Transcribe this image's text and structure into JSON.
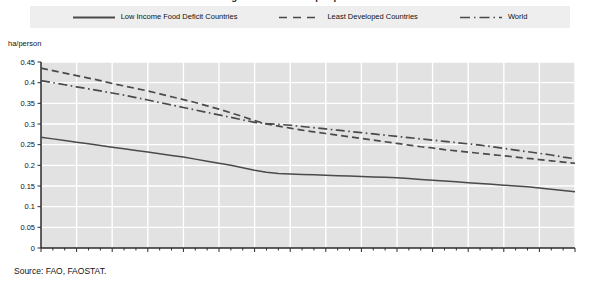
{
  "title": "Figure: Arable land per person",
  "axis": {
    "y_unit_label": "ha/person",
    "y_ticks": [
      "0",
      "0.05",
      "0.1",
      "0.15",
      "0.2",
      "0.25",
      "0.3",
      "0.35",
      "0.4",
      "0.45"
    ],
    "x_ticks": [
      "1963",
      "1966",
      "1969",
      "1972",
      "1975",
      "1978",
      "1981",
      "1984",
      "1987",
      "1990",
      "1993",
      "1996",
      "1999",
      "2002",
      "2005",
      "2008"
    ]
  },
  "legend": {
    "items": [
      {
        "label": "Low Income Food Deficit Countries",
        "style": "solid",
        "color": "#4a4a4a"
      },
      {
        "label": "Least Developed Countries",
        "style": "dashed",
        "color": "#4a4a4a"
      },
      {
        "label": "World",
        "style": "dashdot",
        "color": "#4a4a4a"
      }
    ]
  },
  "source": "Source: FAO, FAOSTAT.",
  "colors": {
    "plot_background": "#e2e2e2",
    "gridline": "#ffffff",
    "axis": "#2b2b2b",
    "legend_background": "#eeeeee",
    "series_line": "#4a4a4a"
  },
  "chart_data": {
    "type": "line",
    "title": "Arable land per person",
    "xlabel": "",
    "ylabel": "ha/person",
    "xlim": [
      1963,
      2008
    ],
    "ylim": [
      0,
      0.45
    ],
    "grid": true,
    "legend_position": "top",
    "x": [
      1963,
      1964,
      1965,
      1966,
      1967,
      1968,
      1969,
      1970,
      1971,
      1972,
      1973,
      1974,
      1975,
      1976,
      1977,
      1978,
      1979,
      1980,
      1981,
      1982,
      1983,
      1984,
      1985,
      1986,
      1987,
      1988,
      1989,
      1990,
      1991,
      1992,
      1993,
      1994,
      1995,
      1996,
      1997,
      1998,
      1999,
      2000,
      2001,
      2002,
      2003,
      2004,
      2005,
      2006,
      2007,
      2008
    ],
    "series": [
      {
        "name": "Low Income Food Deficit Countries",
        "style": "solid",
        "values": [
          0.268,
          0.264,
          0.26,
          0.256,
          0.252,
          0.248,
          0.244,
          0.24,
          0.236,
          0.232,
          0.228,
          0.224,
          0.22,
          0.215,
          0.21,
          0.205,
          0.2,
          0.194,
          0.188,
          0.183,
          0.18,
          0.179,
          0.178,
          0.177,
          0.176,
          0.175,
          0.174,
          0.173,
          0.172,
          0.171,
          0.17,
          0.168,
          0.166,
          0.164,
          0.162,
          0.16,
          0.158,
          0.156,
          0.154,
          0.152,
          0.15,
          0.148,
          0.145,
          0.142,
          0.139,
          0.136
        ]
      },
      {
        "name": "Least Developed Countries",
        "style": "dashed",
        "values": [
          0.435,
          0.429,
          0.423,
          0.417,
          0.411,
          0.405,
          0.398,
          0.392,
          0.386,
          0.38,
          0.373,
          0.366,
          0.359,
          0.352,
          0.344,
          0.336,
          0.327,
          0.318,
          0.308,
          0.3,
          0.295,
          0.29,
          0.285,
          0.281,
          0.277,
          0.273,
          0.269,
          0.265,
          0.261,
          0.257,
          0.253,
          0.249,
          0.245,
          0.242,
          0.238,
          0.235,
          0.232,
          0.229,
          0.226,
          0.223,
          0.22,
          0.217,
          0.214,
          0.211,
          0.208,
          0.205
        ]
      },
      {
        "name": "World",
        "style": "dashdot",
        "values": [
          0.405,
          0.4,
          0.395,
          0.39,
          0.385,
          0.38,
          0.375,
          0.37,
          0.364,
          0.358,
          0.352,
          0.346,
          0.34,
          0.334,
          0.328,
          0.322,
          0.316,
          0.31,
          0.304,
          0.301,
          0.299,
          0.297,
          0.294,
          0.291,
          0.288,
          0.285,
          0.282,
          0.279,
          0.276,
          0.273,
          0.27,
          0.267,
          0.264,
          0.261,
          0.258,
          0.255,
          0.252,
          0.249,
          0.245,
          0.241,
          0.237,
          0.233,
          0.229,
          0.225,
          0.22,
          0.216
        ]
      }
    ]
  }
}
